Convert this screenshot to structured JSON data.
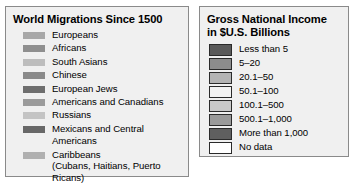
{
  "migrations_legend": {
    "title": "World Migrations Since 1500",
    "items": [
      {
        "label": "Europeans",
        "color": "#a8a8a8"
      },
      {
        "label": "Africans",
        "color": "#8f8f8f"
      },
      {
        "label": "South Asians",
        "color": "#bdbdbd"
      },
      {
        "label": "Chinese",
        "color": "#8a8a8a"
      },
      {
        "label": "European Jews",
        "color": "#6e6e6e"
      },
      {
        "label": "Americans and Canadians",
        "color": "#9b9b9b"
      },
      {
        "label": "Russians",
        "color": "#c4c4c4"
      },
      {
        "label": "Mexicans and Central Americans",
        "color": "#686868"
      },
      {
        "label": "Caribbeans\n(Cubans, Haitians, Puerto Ricans)",
        "color": "#b0b0b0"
      },
      {
        "label": "Southeast Asians",
        "color": "#9e9e9e"
      }
    ]
  },
  "gni_legend": {
    "title": "Gross National Income\nin $U.S. Billions",
    "items": [
      {
        "label": "Less than 5",
        "color": "#5a5a5a"
      },
      {
        "label": "5–20",
        "color": "#8c8c8c"
      },
      {
        "label": "20.1–50",
        "color": "#b3b3b3"
      },
      {
        "label": "50.1–100",
        "color": "#f2f2f2"
      },
      {
        "label": "100.1–500",
        "color": "#c9c9c9"
      },
      {
        "label": "500.1–1,000",
        "color": "#9a9a9a"
      },
      {
        "label": "More than 1,000",
        "color": "#5f5f5f"
      },
      {
        "label": "No data",
        "color": "#ffffff"
      }
    ]
  }
}
